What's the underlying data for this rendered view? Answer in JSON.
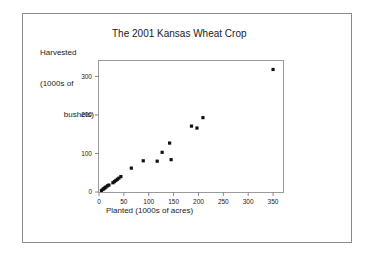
{
  "chart_data": {
    "type": "scatter",
    "title": "The 2001 Kansas Wheat Crop",
    "xlabel": "Planted (1000s of acres)",
    "ylabel_lines": [
      "Harvested",
      "(1000s of",
      "bushels)"
    ],
    "ylabel": "Harvested (1000s of bushels)",
    "xlim": [
      0,
      370
    ],
    "ylim": [
      0,
      340
    ],
    "xticks": [
      0,
      50,
      100,
      150,
      200,
      250,
      300,
      350
    ],
    "yticks": [
      0,
      100,
      200,
      300
    ],
    "grid": false,
    "legend": null,
    "marker_color": "#111111",
    "points": [
      {
        "x": 5,
        "y": 4
      },
      {
        "x": 8,
        "y": 7
      },
      {
        "x": 10,
        "y": 9
      },
      {
        "x": 12,
        "y": 11
      },
      {
        "x": 14,
        "y": 13
      },
      {
        "x": 17,
        "y": 16
      },
      {
        "x": 20,
        "y": 18
      },
      {
        "x": 28,
        "y": 24
      },
      {
        "x": 31,
        "y": 27
      },
      {
        "x": 34,
        "y": 30
      },
      {
        "x": 37,
        "y": 33
      },
      {
        "x": 40,
        "y": 36
      },
      {
        "x": 44,
        "y": 40
      },
      {
        "x": 65,
        "y": 62
      },
      {
        "x": 89,
        "y": 81
      },
      {
        "x": 117,
        "y": 80
      },
      {
        "x": 127,
        "y": 103
      },
      {
        "x": 142,
        "y": 127
      },
      {
        "x": 145,
        "y": 84
      },
      {
        "x": 186,
        "y": 171
      },
      {
        "x": 197,
        "y": 166
      },
      {
        "x": 209,
        "y": 193
      },
      {
        "x": 350,
        "y": 318
      }
    ]
  },
  "colors": {
    "frame": "#8a8a8a",
    "axis": "#8a8a8a",
    "text": "#1a1a1a",
    "marker": "#111111",
    "background": "#ffffff"
  }
}
